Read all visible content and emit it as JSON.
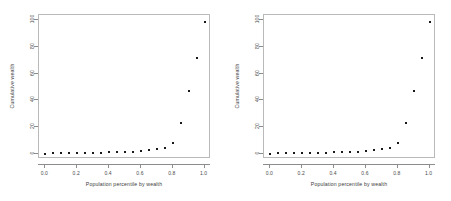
{
  "figure": {
    "background_color": "#ffffff",
    "point_color": "#1a1a1a",
    "axis_color": "#8c8c8c",
    "box_color": "#b9b9b9",
    "panel_count": 2
  },
  "chart_data": [
    {
      "type": "scatter",
      "title": "",
      "xlabel": "Population percentile by wealth",
      "ylabel": "Cumulative wealth",
      "xlim": [
        -0.04,
        1.04
      ],
      "ylim": [
        -4,
        104
      ],
      "xticks": [
        0.0,
        0.2,
        0.4,
        0.6,
        0.8,
        1.0
      ],
      "xticklabels": [
        "0.0",
        "0.2",
        "0.4",
        "0.6",
        "0.8",
        "1.0"
      ],
      "yticks": [
        0,
        20,
        40,
        60,
        80,
        100
      ],
      "yticklabels": [
        "0",
        "20",
        "40",
        "60",
        "80",
        "100"
      ],
      "grid": false,
      "legend": null,
      "marker": "square",
      "x": [
        0.0,
        0.05,
        0.1,
        0.15,
        0.2,
        0.25,
        0.3,
        0.35,
        0.4,
        0.45,
        0.5,
        0.55,
        0.6,
        0.65,
        0.7,
        0.75,
        0.8,
        0.85,
        0.9,
        0.95,
        1.0
      ],
      "y": [
        0.1,
        0.15,
        0.2,
        0.3,
        0.4,
        0.5,
        0.6,
        0.75,
        0.9,
        1.1,
        1.3,
        1.6,
        2.0,
        2.6,
        3.4,
        4.6,
        8.2,
        23.0,
        47.0,
        72.0,
        99.0
      ]
    },
    {
      "type": "scatter",
      "title": "",
      "xlabel": "Population percentile by wealth",
      "ylabel": "Cumulative wealth",
      "xlim": [
        -0.04,
        1.04
      ],
      "ylim": [
        -4,
        104
      ],
      "xticks": [
        0.0,
        0.2,
        0.4,
        0.6,
        0.8,
        1.0
      ],
      "xticklabels": [
        "0.0",
        "0.2",
        "0.4",
        "0.6",
        "0.8",
        "1.0"
      ],
      "yticks": [
        0,
        20,
        40,
        60,
        80,
        100
      ],
      "yticklabels": [
        "0",
        "20",
        "40",
        "60",
        "80",
        "100"
      ],
      "grid": false,
      "legend": null,
      "marker": "square",
      "x": [
        0.0,
        0.05,
        0.1,
        0.15,
        0.2,
        0.25,
        0.3,
        0.35,
        0.4,
        0.45,
        0.5,
        0.55,
        0.6,
        0.65,
        0.7,
        0.75,
        0.8,
        0.85,
        0.9,
        0.95,
        1.0
      ],
      "y": [
        0.1,
        0.15,
        0.2,
        0.3,
        0.4,
        0.5,
        0.6,
        0.75,
        0.9,
        1.1,
        1.3,
        1.6,
        2.0,
        2.6,
        3.4,
        4.6,
        8.2,
        23.0,
        47.0,
        72.0,
        99.0
      ]
    }
  ]
}
